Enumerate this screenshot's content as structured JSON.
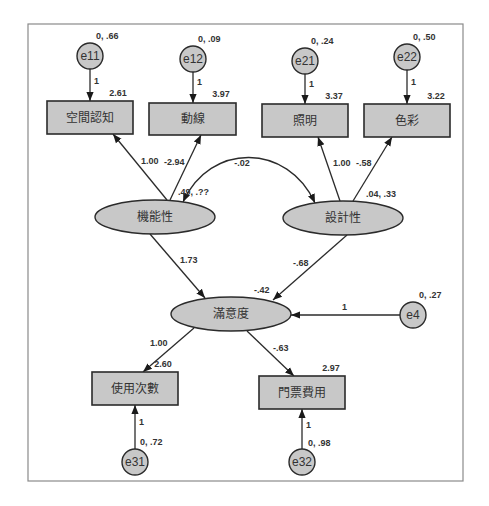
{
  "diagram": {
    "type": "structural-equation-model",
    "frame": {
      "x": 28,
      "y": 24,
      "w": 435,
      "h": 457
    },
    "colors": {
      "node_fill": "#c8c8c8",
      "stroke": "#2b2b2b",
      "label": "#333333",
      "background": "#ffffff",
      "frame": "#888888"
    },
    "latent": [
      {
        "id": "F1",
        "label": "機能性",
        "cx": 155,
        "cy": 217,
        "rx": 60,
        "ry": 17,
        "params": ".49, .??",
        "params_x": 178,
        "params_y": 195
      },
      {
        "id": "F2",
        "label": "設計性",
        "cx": 343,
        "cy": 218,
        "rx": 60,
        "ry": 17,
        "params": ".04, .33",
        "params_x": 366,
        "params_y": 197
      },
      {
        "id": "S",
        "label": "滿意度",
        "cx": 231,
        "cy": 314,
        "rx": 60,
        "ry": 17,
        "params": "-.42",
        "params_x": 254,
        "params_y": 293
      }
    ],
    "observed": [
      {
        "id": "X11",
        "label": "空間認知",
        "x": 47,
        "y": 101,
        "w": 86,
        "h": 33,
        "intercept": "2.61",
        "int_x": 118,
        "int_y": 96
      },
      {
        "id": "X12",
        "label": "動線",
        "x": 149,
        "y": 103,
        "w": 87,
        "h": 32,
        "intercept": "3.97",
        "int_x": 221,
        "int_y": 97
      },
      {
        "id": "X21",
        "label": "照明",
        "x": 262,
        "y": 104,
        "w": 86,
        "h": 33,
        "intercept": "3.37",
        "int_x": 334,
        "int_y": 99
      },
      {
        "id": "X22",
        "label": "色彩",
        "x": 364,
        "y": 104,
        "w": 86,
        "h": 33,
        "intercept": "3.22",
        "int_x": 436,
        "int_y": 99
      },
      {
        "id": "Y1",
        "label": "使用次數",
        "x": 92,
        "y": 372,
        "w": 86,
        "h": 33,
        "intercept": "2.60",
        "int_x": 163,
        "int_y": 367
      },
      {
        "id": "Y2",
        "label": "門票費用",
        "x": 259,
        "y": 376,
        "w": 86,
        "h": 33,
        "intercept": "2.97",
        "int_x": 331,
        "int_y": 371
      }
    ],
    "errors": [
      {
        "id": "e11",
        "label": "e11",
        "cx": 90,
        "cy": 56,
        "r": 13,
        "params": "0, .66",
        "px": 96,
        "py": 39
      },
      {
        "id": "e12",
        "label": "e12",
        "cx": 193,
        "cy": 59,
        "r": 13,
        "params": "0, .09",
        "px": 198,
        "py": 42
      },
      {
        "id": "e21",
        "label": "e21",
        "cx": 305,
        "cy": 61,
        "r": 13,
        "params": "0, .24",
        "px": 311,
        "py": 44
      },
      {
        "id": "e22",
        "label": "e22",
        "cx": 407,
        "cy": 57,
        "r": 13,
        "params": "0, .50",
        "px": 413,
        "py": 40
      },
      {
        "id": "e4",
        "label": "e4",
        "cx": 413,
        "cy": 315,
        "r": 13,
        "params": "0, .27",
        "px": 419,
        "py": 298
      },
      {
        "id": "e31",
        "label": "e31",
        "cx": 135,
        "cy": 462,
        "r": 13,
        "params": "0, .72",
        "px": 140,
        "py": 445
      },
      {
        "id": "e32",
        "label": "e32",
        "cx": 302,
        "cy": 462,
        "r": 13,
        "params": "0, .98",
        "px": 308,
        "py": 446
      }
    ],
    "paths": [
      {
        "from": "e11",
        "to": "空間認知",
        "x1": 90,
        "y1": 69,
        "x2": 90,
        "y2": 101,
        "label": "1",
        "lx": 94,
        "ly": 84
      },
      {
        "from": "e12",
        "to": "動線",
        "x1": 193,
        "y1": 72,
        "x2": 193,
        "y2": 103,
        "label": "1",
        "lx": 197,
        "ly": 85
      },
      {
        "from": "e21",
        "to": "照明",
        "x1": 305,
        "y1": 74,
        "x2": 305,
        "y2": 104,
        "label": "1",
        "lx": 309,
        "ly": 87
      },
      {
        "from": "e22",
        "to": "色彩",
        "x1": 407,
        "y1": 70,
        "x2": 407,
        "y2": 104,
        "label": "1",
        "lx": 411,
        "ly": 85
      },
      {
        "from": "機能性",
        "to": "空間認知",
        "x1": 167,
        "y1": 200,
        "x2": 113,
        "y2": 134,
        "label": "1.00",
        "lx": 141,
        "ly": 164
      },
      {
        "from": "機能性",
        "to": "動線",
        "x1": 170,
        "y1": 200,
        "x2": 201,
        "y2": 135,
        "label": "-2.94",
        "lx": 164,
        "ly": 165
      },
      {
        "from": "設計性",
        "to": "照明",
        "x1": 340,
        "y1": 201,
        "x2": 318,
        "y2": 137,
        "label": "1.00",
        "lx": 333,
        "ly": 166
      },
      {
        "from": "設計性",
        "to": "色彩",
        "x1": 353,
        "y1": 201,
        "x2": 392,
        "y2": 137,
        "label": "-.58",
        "lx": 356,
        "ly": 166
      },
      {
        "from": "機能性",
        "to": "滿意度",
        "x1": 150,
        "y1": 234,
        "x2": 205,
        "y2": 298,
        "label": "1.73",
        "lx": 180,
        "ly": 263
      },
      {
        "from": "設計性",
        "to": "滿意度",
        "x1": 347,
        "y1": 235,
        "x2": 273,
        "y2": 300,
        "label": "-.68",
        "lx": 293,
        "ly": 266
      },
      {
        "from": "e4",
        "to": "滿意度",
        "x1": 400,
        "y1": 315,
        "x2": 291,
        "y2": 315,
        "label": "1",
        "lx": 342,
        "ly": 310
      },
      {
        "from": "滿意度",
        "to": "使用次數",
        "x1": 194,
        "y1": 328,
        "x2": 143,
        "y2": 372,
        "label": "1.00",
        "lx": 150,
        "ly": 346
      },
      {
        "from": "滿意度",
        "to": "門票費用",
        "x1": 247,
        "y1": 331,
        "x2": 294,
        "y2": 376,
        "label": "-.63",
        "lx": 273,
        "ly": 351
      },
      {
        "from": "e31",
        "to": "使用次數",
        "x1": 135,
        "y1": 449,
        "x2": 135,
        "y2": 405,
        "label": "1",
        "lx": 139,
        "ly": 425
      },
      {
        "from": "e32",
        "to": "門票費用",
        "x1": 302,
        "y1": 449,
        "x2": 302,
        "y2": 409,
        "label": "1",
        "lx": 306,
        "ly": 428
      }
    ],
    "covariance": {
      "between": [
        "機能性",
        "設計性"
      ],
      "label": "-.02",
      "lx": 242,
      "ly": 166
    }
  }
}
